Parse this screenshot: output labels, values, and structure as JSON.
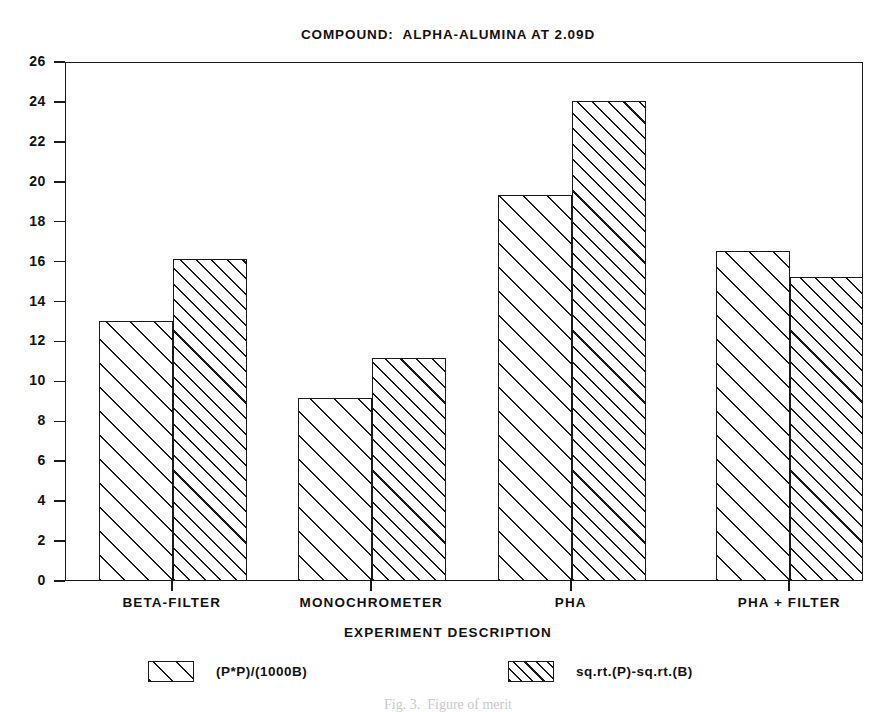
{
  "chart_data": {
    "type": "bar",
    "title": "COMPOUND:  ALPHA-ALUMINA AT 2.09D",
    "xlabel": "EXPERIMENT DESCRIPTION",
    "ylabel": "",
    "categories": [
      "BETA-FILTER",
      "MONOCHROMETER",
      "PHA",
      "PHA + FILTER"
    ],
    "series": [
      {
        "name": "(P*P)/(1000B)",
        "values": [
          13.1,
          9.2,
          19.4,
          16.6
        ]
      },
      {
        "name": "sq.rt.(P)-sq.rt.(B)",
        "values": [
          16.2,
          11.2,
          24.1,
          15.3
        ]
      }
    ],
    "ylim": [
      0,
      26
    ],
    "yticks": [
      0,
      2,
      4,
      6,
      8,
      10,
      12,
      14,
      16,
      18,
      20,
      22,
      24,
      26
    ],
    "ytick_labels": [
      "0",
      "2",
      "4",
      "6",
      "8",
      "10",
      "12",
      "14",
      "16",
      "18",
      "20",
      "22",
      "24",
      "26"
    ],
    "grid": false,
    "legend_position": "below-axis",
    "bar_style": "grouped-adjacent-hatched",
    "colors": {
      "line": "#1a1a1a",
      "fill": "#ffffff",
      "background": "#ffffff"
    }
  },
  "legend": {
    "entries": [
      {
        "label": "(P*P)/(1000B)",
        "pattern": "diagonal-hatch-wide"
      },
      {
        "label": "sq.rt.(P)-sq.rt.(B)",
        "pattern": "diagonal-hatch-dense"
      }
    ]
  },
  "page": {
    "caption": "Fig. 3.  Figure of merit"
  }
}
